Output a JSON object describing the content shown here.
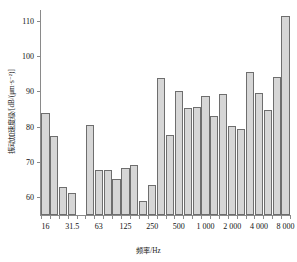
{
  "chart_data": {
    "type": "bar",
    "title": "",
    "xlabel": "频率/Hz",
    "ylabel": "振动加速度级/[dB/(μm·s⁻²)]",
    "ylim": [
      55,
      113
    ],
    "ytick_values": [
      60,
      70,
      80,
      90,
      100,
      110
    ],
    "ytick_labels": [
      "60",
      "70",
      "80",
      "90",
      "100",
      "110"
    ],
    "grid": false,
    "legend": null,
    "categories": [
      "16",
      "20",
      "25",
      "31.5",
      "40",
      "50",
      "63",
      "80",
      "100",
      "125",
      "160",
      "200",
      "250",
      "315",
      "400",
      "500",
      "630",
      "800",
      "1 000",
      "1 250",
      "1 600",
      "2 000",
      "2 500",
      "3 150",
      "4 000",
      "5 000",
      "6 300",
      "8 000"
    ],
    "values": [
      83.8,
      77.3,
      62.8,
      61.1,
      null,
      80.5,
      67.8,
      67.7,
      65.1,
      68.2,
      69.2,
      59.0,
      63.6,
      93.7,
      77.6,
      90.1,
      85.2,
      85.6,
      88.8,
      83.0,
      89.1,
      80.1,
      79.4,
      95.4,
      89.4,
      84.7,
      94.0,
      111.2
    ],
    "xtick_labels": [
      "16",
      "31.5",
      "63",
      "125",
      "250",
      "500",
      "1 000",
      "2 000",
      "4 000",
      "8 000"
    ],
    "xtick_categories": [
      "16",
      "31.5",
      "63",
      "125",
      "250",
      "500",
      "1 000",
      "2 000",
      "4 000",
      "8 000"
    ],
    "bar_fill": "#d6d6d6",
    "bar_edge": "#6e6e6e",
    "axis_color": "#8a8a8a"
  }
}
